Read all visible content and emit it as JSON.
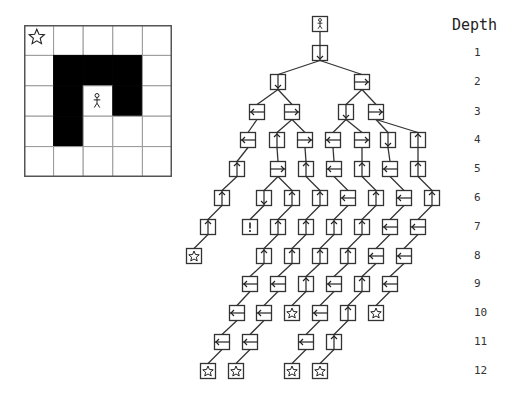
{
  "grid": {
    "rows": 5,
    "cols": 5,
    "walls": [
      [
        1,
        1
      ],
      [
        1,
        2
      ],
      [
        1,
        3
      ],
      [
        2,
        1
      ],
      [
        2,
        3
      ],
      [
        3,
        1
      ]
    ],
    "agent": {
      "row": 2,
      "col": 2,
      "icon": "stick-figure-icon"
    },
    "goal": {
      "row": 0,
      "col": 0,
      "icon": "star-icon"
    },
    "colors": {
      "wall": "#000000",
      "line": "#999999",
      "border": "#555555"
    }
  },
  "depth_header": "Depth",
  "depths": [
    {
      "label": "1",
      "y": 53
    },
    {
      "label": "2",
      "y": 82
    },
    {
      "label": "3",
      "y": 112
    },
    {
      "label": "4",
      "y": 140
    },
    {
      "label": "5",
      "y": 169
    },
    {
      "label": "6",
      "y": 198
    },
    {
      "label": "7",
      "y": 227
    },
    {
      "label": "8",
      "y": 256
    },
    {
      "label": "9",
      "y": 284
    },
    {
      "label": "10",
      "y": 313
    },
    {
      "label": "11",
      "y": 342
    },
    {
      "label": "12",
      "y": 371
    }
  ],
  "tree": {
    "root": {
      "id": "r",
      "x": 320,
      "y": 24,
      "symbol": "agent"
    },
    "nodes": [
      {
        "id": "a",
        "x": 320,
        "y": 53,
        "symbol": "down",
        "parent": "r"
      },
      {
        "id": "b1",
        "x": 278,
        "y": 82,
        "symbol": "down",
        "parent": "a"
      },
      {
        "id": "b2",
        "x": 362,
        "y": 82,
        "symbol": "right",
        "parent": "a"
      },
      {
        "id": "c1",
        "x": 257,
        "y": 112,
        "symbol": "left",
        "parent": "b1"
      },
      {
        "id": "c2",
        "x": 292,
        "y": 112,
        "symbol": "right",
        "parent": "b1"
      },
      {
        "id": "c3",
        "x": 346,
        "y": 112,
        "symbol": "down",
        "parent": "b2"
      },
      {
        "id": "c4",
        "x": 376,
        "y": 112,
        "symbol": "right",
        "parent": "b2"
      },
      {
        "id": "d1",
        "x": 248,
        "y": 140,
        "symbol": "left",
        "parent": "c1"
      },
      {
        "id": "d2",
        "x": 277,
        "y": 140,
        "symbol": "up",
        "parent": "c2"
      },
      {
        "id": "d3",
        "x": 305,
        "y": 140,
        "symbol": "right",
        "parent": "c2"
      },
      {
        "id": "d4",
        "x": 333,
        "y": 140,
        "symbol": "left",
        "parent": "c3"
      },
      {
        "id": "d5",
        "x": 362,
        "y": 140,
        "symbol": "right",
        "parent": "c3"
      },
      {
        "id": "d6",
        "x": 388,
        "y": 140,
        "symbol": "down",
        "parent": "c4"
      },
      {
        "id": "d7",
        "x": 418,
        "y": 140,
        "symbol": "up",
        "parent": "c4"
      },
      {
        "id": "e1",
        "x": 237,
        "y": 169,
        "symbol": "up",
        "parent": "d1"
      },
      {
        "id": "e2",
        "x": 278,
        "y": 169,
        "symbol": "right",
        "parent": "d2"
      },
      {
        "id": "e3",
        "x": 306,
        "y": 169,
        "symbol": "up",
        "parent": "d3"
      },
      {
        "id": "e4",
        "x": 334,
        "y": 169,
        "symbol": "left",
        "parent": "d4"
      },
      {
        "id": "e5",
        "x": 362,
        "y": 169,
        "symbol": "up",
        "parent": "d5"
      },
      {
        "id": "e6",
        "x": 390,
        "y": 169,
        "symbol": "left",
        "parent": "d6"
      },
      {
        "id": "e7",
        "x": 418,
        "y": 169,
        "symbol": "up",
        "parent": "d7"
      },
      {
        "id": "f1",
        "x": 222,
        "y": 198,
        "symbol": "up",
        "parent": "e1"
      },
      {
        "id": "f2",
        "x": 264,
        "y": 198,
        "symbol": "down",
        "parent": "e2"
      },
      {
        "id": "f3",
        "x": 292,
        "y": 198,
        "symbol": "up",
        "parent": "e2"
      },
      {
        "id": "f4",
        "x": 320,
        "y": 198,
        "symbol": "up",
        "parent": "e3"
      },
      {
        "id": "f5",
        "x": 348,
        "y": 198,
        "symbol": "left",
        "parent": "e4"
      },
      {
        "id": "f6",
        "x": 376,
        "y": 198,
        "symbol": "up",
        "parent": "e5"
      },
      {
        "id": "f7",
        "x": 404,
        "y": 198,
        "symbol": "left",
        "parent": "e6"
      },
      {
        "id": "f8",
        "x": 432,
        "y": 198,
        "symbol": "up",
        "parent": "e7"
      },
      {
        "id": "g1",
        "x": 208,
        "y": 227,
        "symbol": "up",
        "parent": "f1"
      },
      {
        "id": "g2",
        "x": 250,
        "y": 227,
        "symbol": "deadend",
        "parent": "f2"
      },
      {
        "id": "g3",
        "x": 278,
        "y": 227,
        "symbol": "up",
        "parent": "f3"
      },
      {
        "id": "g4",
        "x": 306,
        "y": 227,
        "symbol": "up",
        "parent": "f4"
      },
      {
        "id": "g5",
        "x": 334,
        "y": 227,
        "symbol": "up",
        "parent": "f5"
      },
      {
        "id": "g6",
        "x": 362,
        "y": 227,
        "symbol": "up",
        "parent": "f6"
      },
      {
        "id": "g7",
        "x": 390,
        "y": 227,
        "symbol": "left",
        "parent": "f7"
      },
      {
        "id": "g8",
        "x": 418,
        "y": 227,
        "symbol": "left",
        "parent": "f8"
      },
      {
        "id": "h1",
        "x": 194,
        "y": 256,
        "symbol": "goal",
        "parent": "g1"
      },
      {
        "id": "h2",
        "x": 264,
        "y": 256,
        "symbol": "up",
        "parent": "g3"
      },
      {
        "id": "h3",
        "x": 292,
        "y": 256,
        "symbol": "up",
        "parent": "g4"
      },
      {
        "id": "h4",
        "x": 320,
        "y": 256,
        "symbol": "up",
        "parent": "g5"
      },
      {
        "id": "h5",
        "x": 348,
        "y": 256,
        "symbol": "up",
        "parent": "g6"
      },
      {
        "id": "h6",
        "x": 376,
        "y": 256,
        "symbol": "left",
        "parent": "g7"
      },
      {
        "id": "h7",
        "x": 404,
        "y": 256,
        "symbol": "left",
        "parent": "g8"
      },
      {
        "id": "i1",
        "x": 250,
        "y": 284,
        "symbol": "left",
        "parent": "h2"
      },
      {
        "id": "i2",
        "x": 278,
        "y": 284,
        "symbol": "left",
        "parent": "h3"
      },
      {
        "id": "i3",
        "x": 306,
        "y": 284,
        "symbol": "up",
        "parent": "h4"
      },
      {
        "id": "i4",
        "x": 334,
        "y": 284,
        "symbol": "left",
        "parent": "h5"
      },
      {
        "id": "i5",
        "x": 362,
        "y": 284,
        "symbol": "up",
        "parent": "h6"
      },
      {
        "id": "i6",
        "x": 390,
        "y": 284,
        "symbol": "left",
        "parent": "h7"
      },
      {
        "id": "j1",
        "x": 237,
        "y": 313,
        "symbol": "left",
        "parent": "i1"
      },
      {
        "id": "j2",
        "x": 264,
        "y": 313,
        "symbol": "left",
        "parent": "i2"
      },
      {
        "id": "j3",
        "x": 292,
        "y": 313,
        "symbol": "goal",
        "parent": "i3"
      },
      {
        "id": "j4",
        "x": 320,
        "y": 313,
        "symbol": "left",
        "parent": "i4"
      },
      {
        "id": "j5",
        "x": 348,
        "y": 313,
        "symbol": "up",
        "parent": "i5"
      },
      {
        "id": "j6",
        "x": 376,
        "y": 313,
        "symbol": "goal",
        "parent": "i6"
      },
      {
        "id": "k1",
        "x": 222,
        "y": 342,
        "symbol": "left",
        "parent": "j1"
      },
      {
        "id": "k2",
        "x": 250,
        "y": 342,
        "symbol": "left",
        "parent": "j2"
      },
      {
        "id": "k3",
        "x": 306,
        "y": 342,
        "symbol": "left",
        "parent": "j4"
      },
      {
        "id": "k4",
        "x": 334,
        "y": 342,
        "symbol": "up",
        "parent": "j5"
      },
      {
        "id": "l1",
        "x": 208,
        "y": 371,
        "symbol": "goal",
        "parent": "k1"
      },
      {
        "id": "l2",
        "x": 236,
        "y": 371,
        "symbol": "goal",
        "parent": "k2"
      },
      {
        "id": "l3",
        "x": 292,
        "y": 371,
        "symbol": "goal",
        "parent": "k3"
      },
      {
        "id": "l4",
        "x": 320,
        "y": 371,
        "symbol": "goal",
        "parent": "k4"
      }
    ],
    "symbols": {
      "up": "up-arrow-icon",
      "down": "down-arrow-icon",
      "left": "left-arrow-icon",
      "right": "right-arrow-icon",
      "goal": "star-icon",
      "deadend": "exclamation-icon",
      "agent": "stick-figure-icon"
    }
  }
}
